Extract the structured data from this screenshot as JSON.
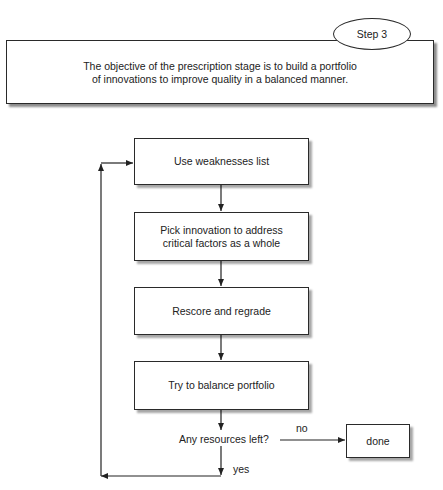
{
  "header": {
    "step_label": "Step 3",
    "objective_line1": "The objective of the prescription stage is to build a portfolio",
    "objective_line2": "of innovations to improve quality in a balanced manner."
  },
  "flowchart": {
    "steps": [
      {
        "label_line1": "Use weaknesses list",
        "label_line2": ""
      },
      {
        "label_line1": "Pick innovation to address",
        "label_line2": "critical factors as a whole"
      },
      {
        "label_line1": "Rescore and regrade",
        "label_line2": ""
      },
      {
        "label_line1": "Try to balance portfolio",
        "label_line2": ""
      }
    ],
    "decision": {
      "question": "Any resources left?",
      "no_label": "no",
      "yes_label": "yes"
    },
    "terminal": {
      "label": "done"
    }
  }
}
